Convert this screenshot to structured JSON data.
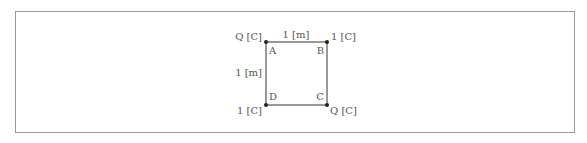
{
  "diagram": {
    "corners": [
      {
        "id": "A",
        "label": "A",
        "charge": "Q [C]"
      },
      {
        "id": "B",
        "label": "B",
        "charge": "1 [C]"
      },
      {
        "id": "C",
        "label": "C",
        "charge": "Q [C]"
      },
      {
        "id": "D",
        "label": "D",
        "charge": "1 [C]"
      }
    ],
    "side_top_label": "1 [m]",
    "side_left_label": "1 [m]",
    "colors": {
      "line": "#555555",
      "point": "#222222",
      "border": "#9a9a9a"
    }
  }
}
